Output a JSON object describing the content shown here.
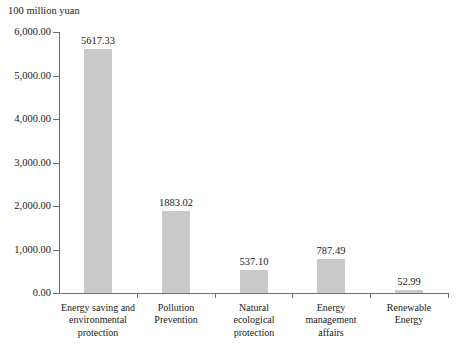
{
  "chart_data": {
    "type": "bar",
    "title": "",
    "subtitle": "",
    "unit_label": "100 million yuan",
    "xlabel": "",
    "ylabel": "",
    "ylim": [
      0,
      6000
    ],
    "grid": false,
    "legend": null,
    "categories": [
      "Energy saving and environmental protection",
      "Pollution Prevention",
      "Natural ecological protection",
      "Energy management affairs",
      "Renewable Energy"
    ],
    "category_lines": [
      [
        "Energy saving and",
        "environmental",
        "protection"
      ],
      [
        "Pollution",
        "Prevention"
      ],
      [
        "Natural",
        "ecological",
        "protection"
      ],
      [
        "Energy",
        "management",
        "affairs"
      ],
      [
        "Renewable",
        "Energy"
      ]
    ],
    "values": [
      5617.33,
      1883.02,
      537.1,
      787.49,
      52.99
    ],
    "value_labels": [
      "5617.33",
      "1883.02",
      "537.10",
      "787.49",
      "52.99"
    ],
    "ytick_values": [
      0,
      1000,
      2000,
      3000,
      4000,
      5000,
      6000
    ],
    "ytick_labels": [
      "0.00",
      "1,000.00",
      "2,000.00",
      "3,000.00",
      "4,000.00",
      "5,000.00",
      "6,000.00"
    ],
    "bar_color": "#c9c9c9",
    "axis_color": "#6e6e6e",
    "text_color": "#1a1a1a"
  }
}
